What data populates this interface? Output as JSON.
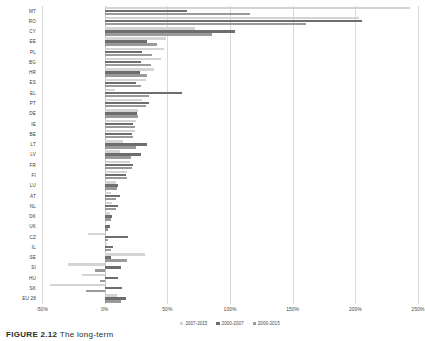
{
  "chart_data": {
    "type": "bar",
    "orientation": "horizontal",
    "title": "",
    "xlabel": "",
    "ylabel": "",
    "xlim": [
      -50,
      250
    ],
    "xticks": [
      -50,
      0,
      50,
      100,
      150,
      200,
      250
    ],
    "xticklabels": [
      "-50%",
      "0%",
      "50%",
      "100%",
      "150%",
      "200%",
      "250%"
    ],
    "grid": true,
    "legend_position": "bottom",
    "categories": [
      "MT",
      "RO",
      "CY",
      "EE",
      "PL",
      "BG",
      "HR",
      "ES",
      "EL",
      "PT",
      "DE",
      "IE",
      "BE",
      "LT",
      "LV",
      "FR",
      "FI",
      "LU",
      "AT",
      "NL",
      "DK",
      "UK",
      "CZ",
      "IL",
      "SE",
      "SI",
      "HU",
      "SK",
      "EU 28"
    ],
    "series": [
      {
        "name": "2007-2015",
        "color": "#d4d4d4",
        "values": [
          244,
          203,
          72,
          49,
          47,
          45,
          39,
          33,
          8,
          30,
          27,
          25,
          24,
          15,
          12,
          20,
          18,
          9,
          5,
          6,
          4,
          1,
          -13,
          2,
          32,
          -29,
          -18,
          -44,
          10
        ]
      },
      {
        "name": "2000-2007",
        "color": "#6e6e6e",
        "values": [
          66,
          205,
          104,
          34,
          30,
          29,
          28,
          25,
          62,
          35,
          26,
          23,
          22,
          34,
          29,
          23,
          17,
          11,
          12,
          11,
          6,
          4,
          19,
          7,
          5,
          13,
          11,
          14,
          17
        ]
      },
      {
        "name": "2000-2015",
        "color": "#9a9a9a",
        "values": [
          116,
          161,
          86,
          42,
          38,
          37,
          34,
          29,
          35,
          33,
          27,
          24,
          23,
          25,
          21,
          22,
          18,
          10,
          9,
          9,
          5,
          3,
          3,
          5,
          18,
          -8,
          -4,
          -15,
          13
        ]
      }
    ]
  },
  "legend": [
    {
      "label": "2007-2015",
      "color": "#d4d4d4"
    },
    {
      "label": "2000-2007",
      "color": "#6e6e6e"
    },
    {
      "label": "2000-2015",
      "color": "#9a9a9a"
    }
  ],
  "caption": {
    "cap_label": "FIGURE 2.12",
    "cap_text": "The long-term"
  }
}
